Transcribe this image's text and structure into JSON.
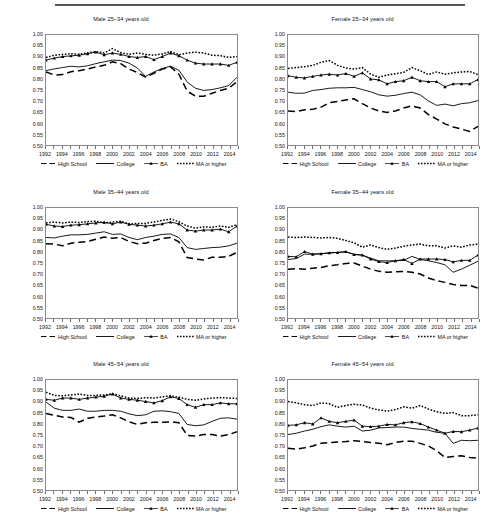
{
  "figure": {
    "panel_titles": [
      "Male 25–34 years old",
      "Female 25–34 years old",
      "Male 35–44 years old",
      "Female 35–44 years old",
      "Male 45–54 years old",
      "Female 45–54 years old"
    ],
    "legend": [
      {
        "label": "High School",
        "style": "dashed"
      },
      {
        "label": "College",
        "style": "solid"
      },
      {
        "label": "BA",
        "style": "solid-marker-triangle"
      },
      {
        "label": "MA or higher",
        "style": "dotted"
      }
    ],
    "y_tick_labels": [
      "1.00",
      "0.95",
      "0.90",
      "0.85",
      "0.80",
      "0.75",
      "0.70",
      "0.65",
      "0.60",
      "0.55",
      "0.50"
    ],
    "x_tick_labels": [
      "1992",
      "1994",
      "1996",
      "1998",
      "2000",
      "2002",
      "2004",
      "2006",
      "2008",
      "2010",
      "2012",
      "2014"
    ]
  },
  "chart_data": [
    {
      "type": "line",
      "title": "Male 25–34 years old",
      "xlabel": "",
      "ylabel": "",
      "xlim": [
        1992,
        2015
      ],
      "ylim": [
        0.5,
        1.0
      ],
      "ytick_step": 0.05,
      "grid": false,
      "legend_position": "below",
      "x": [
        1992,
        1993,
        1994,
        1995,
        1996,
        1997,
        1998,
        1999,
        2000,
        2001,
        2002,
        2003,
        2004,
        2005,
        2006,
        2007,
        2008,
        2009,
        2010,
        2011,
        2012,
        2013,
        2014,
        2015
      ],
      "series": [
        {
          "name": "High School",
          "values": [
            0.832,
            0.818,
            0.82,
            0.833,
            0.838,
            0.845,
            0.855,
            0.862,
            0.878,
            0.87,
            0.845,
            0.83,
            0.808,
            0.826,
            0.845,
            0.855,
            0.822,
            0.745,
            0.722,
            0.722,
            0.735,
            0.748,
            0.758,
            0.788
          ]
        },
        {
          "name": "College",
          "values": [
            0.838,
            0.846,
            0.852,
            0.858,
            0.855,
            0.86,
            0.87,
            0.878,
            0.886,
            0.884,
            0.872,
            0.85,
            0.812,
            0.832,
            0.848,
            0.858,
            0.84,
            0.786,
            0.758,
            0.748,
            0.752,
            0.76,
            0.77,
            0.808
          ]
        },
        {
          "name": "BA",
          "values": [
            0.886,
            0.895,
            0.902,
            0.905,
            0.908,
            0.915,
            0.922,
            0.91,
            0.918,
            0.912,
            0.902,
            0.898,
            0.902,
            0.888,
            0.902,
            0.918,
            0.906,
            0.886,
            0.872,
            0.868,
            0.868,
            0.868,
            0.862,
            0.876
          ]
        },
        {
          "name": "MA or higher",
          "values": [
            0.898,
            0.908,
            0.912,
            0.915,
            0.912,
            0.918,
            0.924,
            0.918,
            0.938,
            0.92,
            0.912,
            0.918,
            0.912,
            0.908,
            0.914,
            0.925,
            0.91,
            0.918,
            0.922,
            0.918,
            0.908,
            0.906,
            0.898,
            0.902
          ]
        }
      ]
    },
    {
      "type": "line",
      "title": "Female 25–34 years old",
      "xlabel": "",
      "ylabel": "",
      "xlim": [
        1992,
        2015
      ],
      "ylim": [
        0.5,
        1.0
      ],
      "ytick_step": 0.05,
      "grid": false,
      "legend_position": "below",
      "x": [
        1992,
        1993,
        1994,
        1995,
        1996,
        1997,
        1998,
        1999,
        2000,
        2001,
        2002,
        2003,
        2004,
        2005,
        2006,
        2007,
        2008,
        2009,
        2010,
        2011,
        2012,
        2013,
        2014,
        2015
      ],
      "series": [
        {
          "name": "High School",
          "values": [
            0.655,
            0.652,
            0.66,
            0.662,
            0.672,
            0.692,
            0.698,
            0.705,
            0.71,
            0.688,
            0.668,
            0.655,
            0.648,
            0.655,
            0.668,
            0.678,
            0.668,
            0.638,
            0.618,
            0.596,
            0.582,
            0.572,
            0.562,
            0.585
          ]
        },
        {
          "name": "College",
          "values": [
            0.74,
            0.735,
            0.736,
            0.748,
            0.752,
            0.758,
            0.76,
            0.76,
            0.762,
            0.752,
            0.742,
            0.728,
            0.722,
            0.726,
            0.734,
            0.74,
            0.728,
            0.7,
            0.68,
            0.686,
            0.678,
            0.688,
            0.692,
            0.702
          ]
        },
        {
          "name": "BA",
          "values": [
            0.815,
            0.808,
            0.805,
            0.812,
            0.818,
            0.822,
            0.818,
            0.825,
            0.812,
            0.828,
            0.8,
            0.796,
            0.778,
            0.788,
            0.792,
            0.808,
            0.792,
            0.788,
            0.788,
            0.765,
            0.778,
            0.778,
            0.778,
            0.798
          ]
        },
        {
          "name": "MA or higher",
          "values": [
            0.848,
            0.852,
            0.856,
            0.862,
            0.876,
            0.884,
            0.862,
            0.85,
            0.845,
            0.852,
            0.822,
            0.808,
            0.818,
            0.824,
            0.83,
            0.852,
            0.838,
            0.82,
            0.832,
            0.822,
            0.828,
            0.832,
            0.834,
            0.82
          ]
        }
      ]
    },
    {
      "type": "line",
      "title": "Male 35–44 years old",
      "xlabel": "",
      "ylabel": "",
      "xlim": [
        1992,
        2015
      ],
      "ylim": [
        0.5,
        1.0
      ],
      "ytick_step": 0.05,
      "grid": false,
      "legend_position": "below",
      "x": [
        1992,
        1993,
        1994,
        1995,
        1996,
        1997,
        1998,
        1999,
        2000,
        2001,
        2002,
        2003,
        2004,
        2005,
        2006,
        2007,
        2008,
        2009,
        2010,
        2011,
        2012,
        2013,
        2014,
        2015
      ],
      "series": [
        {
          "name": "High School",
          "values": [
            0.838,
            0.836,
            0.828,
            0.84,
            0.844,
            0.848,
            0.858,
            0.868,
            0.862,
            0.866,
            0.848,
            0.838,
            0.84,
            0.852,
            0.862,
            0.866,
            0.846,
            0.775,
            0.768,
            0.764,
            0.776,
            0.776,
            0.78,
            0.798
          ]
        },
        {
          "name": "College",
          "values": [
            0.866,
            0.864,
            0.872,
            0.878,
            0.878,
            0.88,
            0.886,
            0.892,
            0.88,
            0.882,
            0.866,
            0.856,
            0.866,
            0.872,
            0.88,
            0.882,
            0.866,
            0.82,
            0.812,
            0.816,
            0.82,
            0.822,
            0.828,
            0.84
          ]
        },
        {
          "name": "BA",
          "values": [
            0.926,
            0.918,
            0.916,
            0.922,
            0.924,
            0.928,
            0.932,
            0.935,
            0.928,
            0.936,
            0.926,
            0.922,
            0.918,
            0.922,
            0.928,
            0.936,
            0.928,
            0.9,
            0.895,
            0.9,
            0.9,
            0.904,
            0.892,
            0.918
          ]
        },
        {
          "name": "MA or higher",
          "values": [
            0.932,
            0.936,
            0.932,
            0.936,
            0.934,
            0.938,
            0.94,
            0.932,
            0.936,
            0.94,
            0.928,
            0.93,
            0.93,
            0.936,
            0.944,
            0.95,
            0.938,
            0.918,
            0.908,
            0.914,
            0.912,
            0.918,
            0.912,
            0.924
          ]
        }
      ]
    },
    {
      "type": "line",
      "title": "Female 35–44 years old",
      "xlabel": "",
      "ylabel": "",
      "xlim": [
        1992,
        2015
      ],
      "ylim": [
        0.5,
        1.0
      ],
      "ytick_step": 0.05,
      "grid": false,
      "legend_position": "below",
      "x": [
        1992,
        1993,
        1994,
        1995,
        1996,
        1997,
        1998,
        1999,
        2000,
        2001,
        2002,
        2003,
        2004,
        2005,
        2006,
        2007,
        2008,
        2009,
        2010,
        2011,
        2012,
        2013,
        2014,
        2015
      ],
      "series": [
        {
          "name": "High School",
          "values": [
            0.722,
            0.724,
            0.722,
            0.726,
            0.73,
            0.738,
            0.742,
            0.748,
            0.75,
            0.736,
            0.722,
            0.712,
            0.708,
            0.71,
            0.712,
            0.708,
            0.7,
            0.682,
            0.67,
            0.662,
            0.652,
            0.648,
            0.648,
            0.636
          ]
        },
        {
          "name": "College",
          "values": [
            0.766,
            0.77,
            0.79,
            0.79,
            0.792,
            0.796,
            0.798,
            0.8,
            0.79,
            0.786,
            0.772,
            0.76,
            0.76,
            0.76,
            0.762,
            0.78,
            0.766,
            0.76,
            0.752,
            0.742,
            0.708,
            0.722,
            0.74,
            0.758
          ]
        },
        {
          "name": "BA",
          "values": [
            0.78,
            0.778,
            0.802,
            0.79,
            0.792,
            0.796,
            0.798,
            0.802,
            0.788,
            0.786,
            0.768,
            0.756,
            0.752,
            0.76,
            0.766,
            0.748,
            0.768,
            0.768,
            0.768,
            0.766,
            0.755,
            0.762,
            0.762,
            0.786
          ]
        },
        {
          "name": "MA or higher",
          "values": [
            0.868,
            0.866,
            0.868,
            0.866,
            0.864,
            0.866,
            0.862,
            0.852,
            0.842,
            0.822,
            0.832,
            0.82,
            0.812,
            0.818,
            0.826,
            0.832,
            0.836,
            0.828,
            0.828,
            0.818,
            0.828,
            0.822,
            0.832,
            0.836
          ]
        }
      ]
    },
    {
      "type": "line",
      "title": "Male 45–54 years old",
      "xlabel": "",
      "ylabel": "",
      "xlim": [
        1992,
        2015
      ],
      "ylim": [
        0.5,
        1.0
      ],
      "ytick_step": 0.05,
      "grid": false,
      "legend_position": "below",
      "x": [
        1992,
        1993,
        1994,
        1995,
        1996,
        1997,
        1998,
        1999,
        2000,
        2001,
        2002,
        2003,
        2004,
        2005,
        2006,
        2007,
        2008,
        2009,
        2010,
        2011,
        2012,
        2013,
        2014,
        2015
      ],
      "series": [
        {
          "name": "High School",
          "values": [
            0.848,
            0.84,
            0.832,
            0.83,
            0.808,
            0.826,
            0.832,
            0.836,
            0.842,
            0.828,
            0.81,
            0.798,
            0.806,
            0.808,
            0.808,
            0.81,
            0.806,
            0.748,
            0.745,
            0.752,
            0.752,
            0.745,
            0.752,
            0.765
          ]
        },
        {
          "name": "College",
          "values": [
            0.9,
            0.872,
            0.862,
            0.862,
            0.868,
            0.858,
            0.858,
            0.862,
            0.862,
            0.858,
            0.846,
            0.838,
            0.842,
            0.858,
            0.86,
            0.856,
            0.848,
            0.798,
            0.792,
            0.796,
            0.812,
            0.826,
            0.828,
            0.822
          ]
        },
        {
          "name": "BA",
          "values": [
            0.912,
            0.908,
            0.918,
            0.918,
            0.912,
            0.918,
            0.922,
            0.926,
            0.936,
            0.918,
            0.912,
            0.908,
            0.902,
            0.896,
            0.906,
            0.924,
            0.916,
            0.888,
            0.876,
            0.888,
            0.888,
            0.896,
            0.892,
            0.892
          ]
        },
        {
          "name": "MA or higher",
          "values": [
            0.944,
            0.93,
            0.928,
            0.932,
            0.936,
            0.93,
            0.93,
            0.932,
            0.938,
            0.928,
            0.918,
            0.916,
            0.92,
            0.918,
            0.924,
            0.928,
            0.922,
            0.912,
            0.908,
            0.914,
            0.918,
            0.92,
            0.918,
            0.916
          ]
        }
      ]
    },
    {
      "type": "line",
      "title": "Female 45–54 years old",
      "xlabel": "",
      "ylabel": "",
      "xlim": [
        1992,
        2015
      ],
      "ylim": [
        0.5,
        1.0
      ],
      "ytick_step": 0.05,
      "grid": false,
      "legend_position": "below",
      "x": [
        1992,
        1993,
        1994,
        1995,
        1996,
        1997,
        1998,
        1999,
        2000,
        2001,
        2002,
        2003,
        2004,
        2005,
        2006,
        2007,
        2008,
        2009,
        2010,
        2011,
        2012,
        2013,
        2014,
        2015
      ],
      "series": [
        {
          "name": "High School",
          "values": [
            0.69,
            0.686,
            0.692,
            0.7,
            0.712,
            0.716,
            0.718,
            0.72,
            0.724,
            0.72,
            0.716,
            0.712,
            0.706,
            0.716,
            0.722,
            0.722,
            0.712,
            0.7,
            0.678,
            0.648,
            0.652,
            0.656,
            0.648,
            0.645
          ]
        },
        {
          "name": "College",
          "values": [
            0.752,
            0.758,
            0.768,
            0.776,
            0.788,
            0.796,
            0.79,
            0.786,
            0.79,
            0.768,
            0.772,
            0.782,
            0.784,
            0.786,
            0.786,
            0.78,
            0.776,
            0.772,
            0.762,
            0.758,
            0.712,
            0.726,
            0.724,
            0.726
          ]
        },
        {
          "name": "BA",
          "values": [
            0.794,
            0.796,
            0.806,
            0.8,
            0.828,
            0.812,
            0.806,
            0.812,
            0.818,
            0.79,
            0.788,
            0.79,
            0.798,
            0.796,
            0.806,
            0.81,
            0.802,
            0.786,
            0.772,
            0.758,
            0.766,
            0.765,
            0.772,
            0.782
          ]
        },
        {
          "name": "MA or higher",
          "values": [
            0.902,
            0.896,
            0.888,
            0.884,
            0.896,
            0.892,
            0.876,
            0.884,
            0.89,
            0.886,
            0.872,
            0.864,
            0.858,
            0.866,
            0.878,
            0.872,
            0.884,
            0.868,
            0.856,
            0.848,
            0.852,
            0.838,
            0.838,
            0.842
          ]
        }
      ]
    }
  ]
}
